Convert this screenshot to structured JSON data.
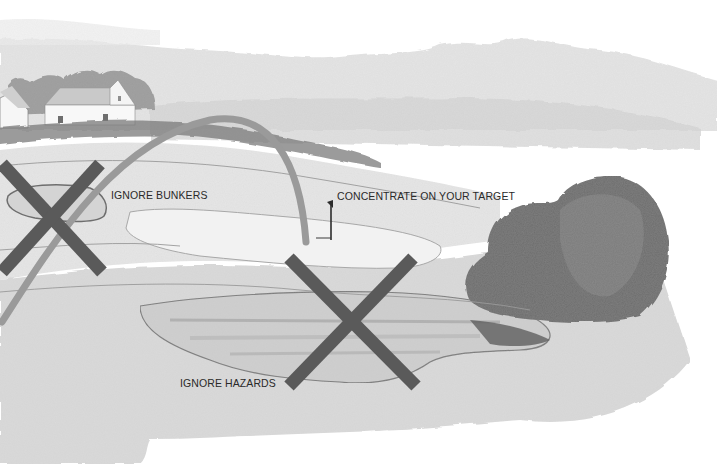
{
  "illustration": {
    "subject": "golf hole watercolor",
    "labels": {
      "bunkers": "IGNORE BUNKERS",
      "target": "CONCENTRATE ON YOUR TARGET",
      "hazards": "IGNORE HAZARDS"
    },
    "colors": {
      "background": "#ffffff",
      "x_mark": "#5a5a5a",
      "ball_flight_arc": "#9a9a9a",
      "text": "#2a2a2a",
      "tree": "#6a6a6a",
      "fairway": "#dcdcdc",
      "water": "#bdbdbd"
    },
    "markers": [
      {
        "type": "x-mark",
        "meaning": "bunker",
        "label_key": "bunkers"
      },
      {
        "type": "x-mark",
        "meaning": "water hazard",
        "label_key": "hazards"
      },
      {
        "type": "flag",
        "meaning": "target pin",
        "label_key": "target"
      }
    ]
  }
}
